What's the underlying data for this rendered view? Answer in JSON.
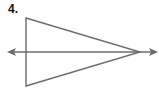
{
  "problem": {
    "number_label": "4."
  },
  "figure": {
    "stroke_color": "#6b6b6b",
    "triangle": {
      "vertices": [
        [
          26,
          18
        ],
        [
          26,
          86
        ],
        [
          140,
          52
        ]
      ]
    },
    "line": {
      "y": 52,
      "x_start": 8,
      "x_end": 157,
      "arrowheads": "both"
    }
  }
}
